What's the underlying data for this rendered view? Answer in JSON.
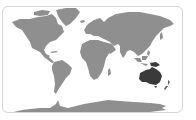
{
  "map": {
    "type": "world-map",
    "projection": "equirectangular",
    "highlighted_region": "Australia / Oceania",
    "highlight_color": "#3a3a3a",
    "land_color": "#8f8f8f",
    "ocean_color": "#ffffff",
    "border_color": "#d4d4d4",
    "regions": [
      {
        "name": "North America",
        "highlighted": false
      },
      {
        "name": "Greenland",
        "highlighted": false
      },
      {
        "name": "South America",
        "highlighted": false
      },
      {
        "name": "Europe",
        "highlighted": false
      },
      {
        "name": "Africa",
        "highlighted": false
      },
      {
        "name": "Madagascar",
        "highlighted": false
      },
      {
        "name": "Asia",
        "highlighted": false
      },
      {
        "name": "Southeast Asia islands",
        "highlighted": false
      },
      {
        "name": "Australia",
        "highlighted": true
      },
      {
        "name": "New Guinea",
        "highlighted": true
      },
      {
        "name": "New Zealand",
        "highlighted": true
      },
      {
        "name": "Antarctica",
        "highlighted": false
      }
    ]
  }
}
